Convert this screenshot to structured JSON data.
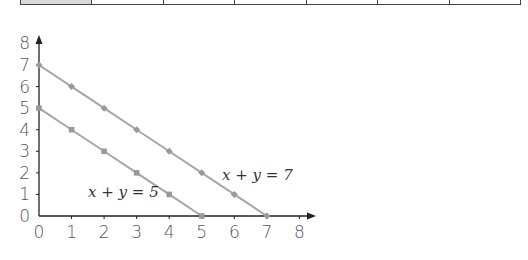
{
  "table_strip": {
    "columns": 7,
    "header_cell_shaded": true
  },
  "chart_data": {
    "type": "line",
    "title": "",
    "xlabel": "",
    "ylabel": "",
    "xlim": [
      0,
      8
    ],
    "ylim": [
      0,
      8
    ],
    "x_ticks": [
      "0",
      "1",
      "2",
      "3",
      "4",
      "5",
      "6",
      "7",
      "8"
    ],
    "y_ticks": [
      "0",
      "1",
      "2",
      "3",
      "4",
      "5",
      "6",
      "7",
      "8"
    ],
    "grid": false,
    "series": [
      {
        "name": "x + y = 7",
        "marker": "diamond",
        "color": "#a6a6a6",
        "x": [
          0,
          1,
          2,
          3,
          4,
          5,
          6,
          7
        ],
        "y": [
          7,
          6,
          5,
          4,
          3,
          2,
          1,
          0
        ]
      },
      {
        "name": "x + y = 5",
        "marker": "square",
        "color": "#a6a6a6",
        "x": [
          0,
          1,
          2,
          3,
          4,
          5
        ],
        "y": [
          5,
          4,
          3,
          2,
          1,
          0
        ]
      }
    ],
    "annotations": [
      {
        "text": "x + y = 7",
        "near": [
          6,
          1.6
        ]
      },
      {
        "text": "x + y = 5",
        "near": [
          1.6,
          0.9
        ]
      }
    ]
  },
  "labels": {
    "eq7": "x + y = 7",
    "eq5": "x + y = 5"
  }
}
